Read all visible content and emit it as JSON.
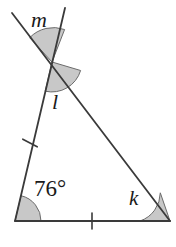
{
  "figure": {
    "name": "triangle-with-transversal-angles",
    "background_color": "#ffffff",
    "stroke_color": "#3a3a3a",
    "arc_fill_color": "#c8c8c8",
    "arc_stroke_color": "#6b6b6b"
  },
  "labels": {
    "angle_m": "m",
    "angle_l": "l",
    "angle_k": "k",
    "angle_known": "76°"
  },
  "geometry": {
    "points": {
      "transversal_top_left": [
        12,
        13
      ],
      "vertical_top": [
        65,
        8
      ],
      "crossing": [
        52,
        62
      ],
      "bottom_left": [
        15,
        221
      ],
      "bottom_right": [
        170,
        221
      ]
    },
    "tick_marks": [
      {
        "name": "left-side-tick",
        "position": [
          30,
          143
        ]
      },
      {
        "name": "bottom-side-tick",
        "position": [
          92,
          221
        ]
      }
    ],
    "arcs": [
      {
        "name": "angle-m-arc",
        "vertex": [
          52,
          62
        ],
        "radius": 33
      },
      {
        "name": "angle-l-arc",
        "vertex": [
          52,
          62
        ],
        "radius": 30
      },
      {
        "name": "angle-76-arc",
        "vertex": [
          15,
          221
        ],
        "radius": 26
      },
      {
        "name": "angle-k-arc",
        "vertex": [
          170,
          221
        ],
        "radius": 30
      }
    ]
  }
}
